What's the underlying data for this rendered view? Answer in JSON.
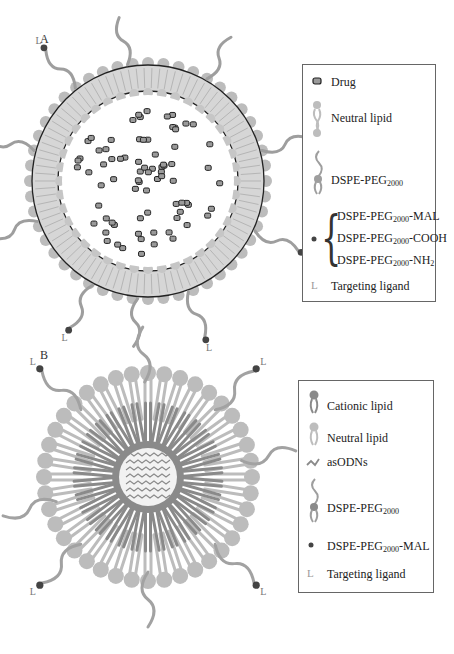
{
  "panels": {
    "a": {
      "label": "A",
      "legend": {
        "drug": "Drug",
        "neutral_lipid": "Neutral lipid",
        "dspe_peg_base": "DSPE-PEG",
        "dspe_peg_sub": "2000",
        "variants": [
          {
            "base": "DSPE-PEG",
            "sub": "2000",
            "suffix": "-MAL"
          },
          {
            "base": "DSPE-PEG",
            "sub": "2000",
            "suffix": "-COOH"
          },
          {
            "base": "DSPE-PEG",
            "sub": "2000",
            "suffix": "-NH",
            "suffix_sub": "2"
          }
        ],
        "targeting_ligand": "Targeting ligand"
      },
      "figure": "Liposome: lipid bilayer shell with encapsulated drug particles and PEG chains carrying targeting ligands"
    },
    "b": {
      "label": "B",
      "legend": {
        "cationic_lipid": "Cationic lipid",
        "neutral_lipid": "Neutral lipid",
        "asodns": "asODNs",
        "dspe_peg_base": "DSPE-PEG",
        "dspe_peg_sub": "2000",
        "dspe_peg_mal_base": "DSPE-PEG",
        "dspe_peg_mal_sub": "2000",
        "dspe_peg_mal_suffix": "-MAL",
        "targeting_ligand": "Targeting ligand"
      },
      "figure": "Lipoplex: cationic lipid core complexing asODNs surrounded by neutral lipid corona with PEG chains carrying targeting ligands"
    }
  },
  "colors": {
    "light_lipid": "#bcbcbc",
    "dark_lipid": "#8a8a8a",
    "bilayer_fill": "#d8d8d8",
    "drug_fill": "#9a9a9a",
    "maleimide_dot": "#444444",
    "outline": "#222222"
  },
  "glyphs": {
    "ligand": "L"
  }
}
